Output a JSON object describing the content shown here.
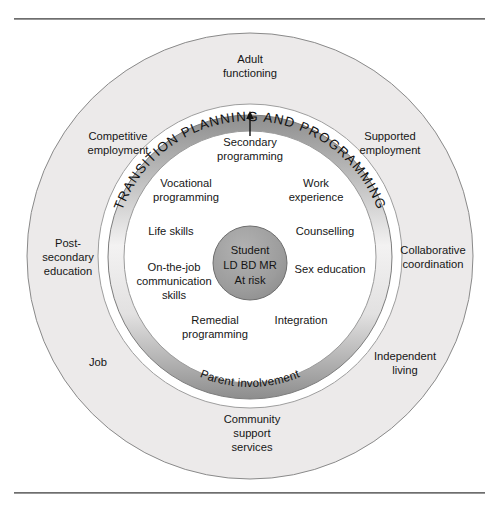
{
  "diagram": {
    "colors": {
      "outer_ring_fill": "#eceaea",
      "outer_ring_stroke": "#8a8a8a",
      "mid_gap_fill": "#ffffff",
      "band_light": "#f2f1f1",
      "band_dark": "#8e8e8e",
      "band_stroke": "#7d7d7d",
      "inner_circle_fill": "#ffffff",
      "inner_circle_stroke": "#9b9b9b",
      "core_fill": "#9d9d9d",
      "core_stroke": "#6d6d6d",
      "text": "#161616",
      "rule": "#6e6e6e"
    },
    "band": {
      "arc_title": "TRANSITION PLANNING AND PROGRAMMING",
      "arc_subtitle": "Parent involvement",
      "arrow": "arrow-up-from-secondary-programming"
    },
    "outer_ring_labels": [
      {
        "id": "adult-functioning",
        "lines": [
          "Adult",
          "functioning"
        ],
        "x": 250,
        "y": 63,
        "anchor": "middle"
      },
      {
        "id": "competitive-employment",
        "lines": [
          "Competitive",
          "employment"
        ],
        "x": 118,
        "y": 140,
        "anchor": "middle"
      },
      {
        "id": "supported-employment",
        "lines": [
          "Supported",
          "employment"
        ],
        "x": 390,
        "y": 140,
        "anchor": "middle"
      },
      {
        "id": "post-secondary-education",
        "lines": [
          "Post-",
          "secondary",
          "education"
        ],
        "x": 68,
        "y": 247,
        "anchor": "middle"
      },
      {
        "id": "collaborative-coordination",
        "lines": [
          "Collaborative",
          "coordination"
        ],
        "x": 433,
        "y": 254,
        "anchor": "middle"
      },
      {
        "id": "job",
        "lines": [
          "Job"
        ],
        "x": 98,
        "y": 366,
        "anchor": "middle"
      },
      {
        "id": "independent-living",
        "lines": [
          "Independent",
          "living"
        ],
        "x": 405,
        "y": 360,
        "anchor": "middle"
      },
      {
        "id": "community-support-services",
        "lines": [
          "Community",
          "support",
          "services"
        ],
        "x": 252,
        "y": 423,
        "anchor": "middle"
      }
    ],
    "inner_circle_labels": [
      {
        "id": "secondary-programming",
        "lines": [
          "Secondary",
          "programming"
        ],
        "x": 250,
        "y": 146,
        "anchor": "middle"
      },
      {
        "id": "vocational-programming",
        "lines": [
          "Vocational",
          "programming"
        ],
        "x": 186,
        "y": 187,
        "anchor": "middle"
      },
      {
        "id": "work-experience",
        "lines": [
          "Work",
          "experience"
        ],
        "x": 316,
        "y": 187,
        "anchor": "middle"
      },
      {
        "id": "life-skills",
        "lines": [
          "Life skills"
        ],
        "x": 171,
        "y": 235,
        "anchor": "middle"
      },
      {
        "id": "counselling",
        "lines": [
          "Counselling"
        ],
        "x": 325,
        "y": 235,
        "anchor": "middle"
      },
      {
        "id": "on-the-job-communication-skills",
        "lines": [
          "On-the-job",
          "communication",
          "skills"
        ],
        "x": 174,
        "y": 271,
        "anchor": "middle"
      },
      {
        "id": "sex-education",
        "lines": [
          "Sex education"
        ],
        "x": 330,
        "y": 273,
        "anchor": "middle"
      },
      {
        "id": "remedial-programming",
        "lines": [
          "Remedial",
          "programming"
        ],
        "x": 215,
        "y": 324,
        "anchor": "middle"
      },
      {
        "id": "integration",
        "lines": [
          "Integration"
        ],
        "x": 301,
        "y": 324,
        "anchor": "middle"
      }
    ],
    "core": {
      "id": "student-core",
      "lines": [
        "Student",
        "LD  BD  MR",
        "At risk"
      ],
      "cx": 250,
      "cy": 263,
      "r": 37
    }
  }
}
